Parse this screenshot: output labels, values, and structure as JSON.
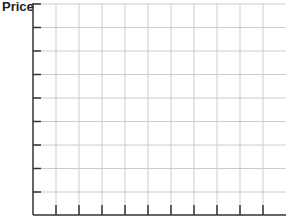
{
  "chart_data": {
    "type": "line",
    "title": "",
    "xlabel": "",
    "ylabel": "Price",
    "grid": true,
    "series": [],
    "x_ticks_count": 11,
    "y_ticks_count": 9,
    "x_tick_labels": [],
    "y_tick_labels": [],
    "legend": []
  },
  "colors": {
    "axis": "#333333",
    "grid": "#cccccc"
  }
}
